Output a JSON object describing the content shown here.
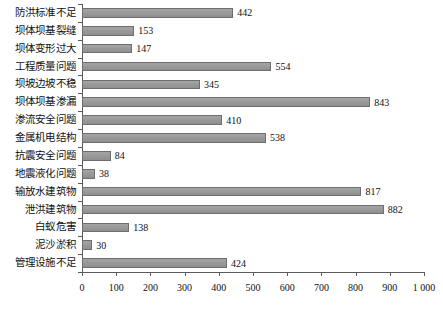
{
  "chart_data": {
    "type": "bar",
    "orientation": "horizontal",
    "title": "",
    "subtitle": "",
    "xlabel": "",
    "ylabel": "",
    "xlim": [
      0,
      1000
    ],
    "grid": false,
    "legend": null,
    "categories": [
      "防洪标准不足",
      "坝体坝基裂缝",
      "坝体变形过大",
      "工程质量问题",
      "坝坡边坡不稳",
      "坝体坝基渗漏",
      "渗流安全问题",
      "金属机电结构",
      "抗震安全问题",
      "地震液化问题",
      "输放水建筑物",
      "泄洪建筑物",
      "白蚁危害",
      "泥沙淤积",
      "管理设施不足"
    ],
    "values": [
      442,
      153,
      147,
      554,
      345,
      843,
      410,
      538,
      84,
      38,
      817,
      882,
      138,
      30,
      424
    ],
    "value_labels": [
      "442",
      "153",
      "147",
      "554",
      "345",
      "843",
      "410",
      "538",
      "84",
      "38",
      "817",
      "882",
      "138",
      "30",
      "424"
    ],
    "xticks": [
      0,
      100,
      200,
      300,
      400,
      500,
      600,
      700,
      800,
      900,
      1000
    ],
    "xtick_labels": [
      "0",
      "100",
      "200",
      "300",
      "400",
      "500",
      "600",
      "700",
      "800",
      "900",
      "1 000"
    ],
    "colors": {
      "bar_fill": "#9a9a9a",
      "bar_edge": "#6e6e6e",
      "axis": "#5a5a5a",
      "text": "#111111",
      "background": "#ffffff"
    }
  }
}
